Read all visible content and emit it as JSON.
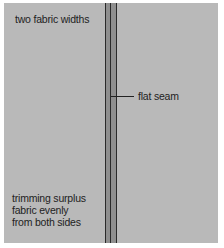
{
  "diagram": {
    "labels": {
      "top_left": "two fabric widths",
      "seam": "flat seam",
      "bottom_left": "trimming surplus\nfabric evenly\nfrom both sides"
    },
    "colors": {
      "fabric": "#b9b9b9",
      "seam_band": "#8f8f8f",
      "seam_line": "#2a2a2a",
      "background": "#ffffff"
    }
  }
}
